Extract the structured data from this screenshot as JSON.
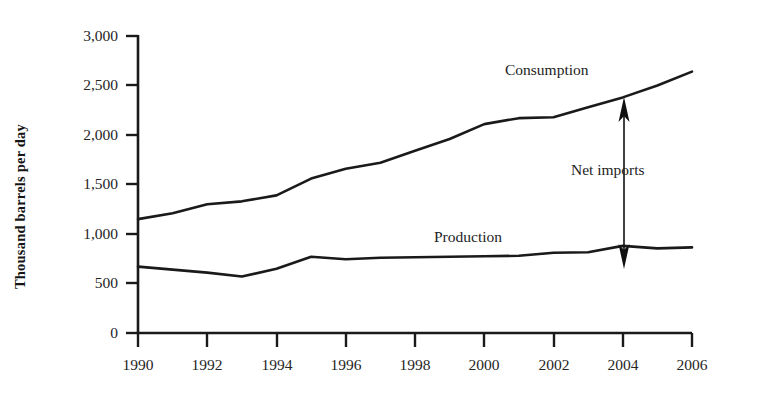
{
  "figure": {
    "y_axis_title": "Thousand barrels per day"
  },
  "annotations": {
    "consumption_label": "Consumption",
    "production_label": "Production",
    "net_imports_label": "Net imports"
  },
  "axes": {
    "y_ticks": [
      "3,000",
      "2,500",
      "2,000",
      "1,500",
      "1,000",
      "500",
      "0"
    ],
    "x_ticks": [
      "1990",
      "1992",
      "1994",
      "1996",
      "1998",
      "2000",
      "2002",
      "2004",
      "2006"
    ]
  },
  "colors": {
    "line": "#1a1a1a",
    "axis": "#1a1a1a",
    "arrow": "#111111",
    "background": "#ffffff"
  },
  "chart_data": {
    "type": "line",
    "title": "",
    "subtitle": "",
    "xlabel": "",
    "ylabel": "Thousand barrels per day",
    "xlim": [
      1990,
      2006
    ],
    "ylim": [
      0,
      3000
    ],
    "ytick_values": [
      3000,
      2500,
      2000,
      1500,
      1000,
      500,
      0
    ],
    "xtick_values": [
      1990,
      1992,
      1994,
      1996,
      1998,
      2000,
      2002,
      2004,
      2006
    ],
    "grid": false,
    "legend": "inline-labels",
    "x": [
      1990,
      1991,
      1992,
      1993,
      1994,
      1995,
      1996,
      1997,
      1998,
      1999,
      2000,
      2001,
      2002,
      2003,
      2004,
      2005,
      2006
    ],
    "series": [
      {
        "name": "Consumption",
        "values": [
          1150,
          1210,
          1300,
          1330,
          1390,
          1560,
          1660,
          1720,
          1840,
          1960,
          2110,
          2170,
          2180,
          2280,
          2380,
          2500,
          2640
        ]
      },
      {
        "name": "Production",
        "values": [
          670,
          640,
          610,
          570,
          650,
          770,
          745,
          760,
          765,
          770,
          775,
          780,
          810,
          815,
          880,
          855,
          865
        ]
      }
    ],
    "annotations": [
      {
        "text": "Net imports",
        "type": "double-arrow",
        "x": 2004,
        "y_from": 880,
        "y_to": 2380,
        "description": "Vertical double-headed arrow spanning the gap between Production and Consumption at 2004"
      },
      {
        "text": "Consumption",
        "type": "series-label",
        "x": 2001,
        "y": 2650
      },
      {
        "text": "Production",
        "type": "series-label",
        "x": 1998.5,
        "y": 1030
      }
    ]
  }
}
